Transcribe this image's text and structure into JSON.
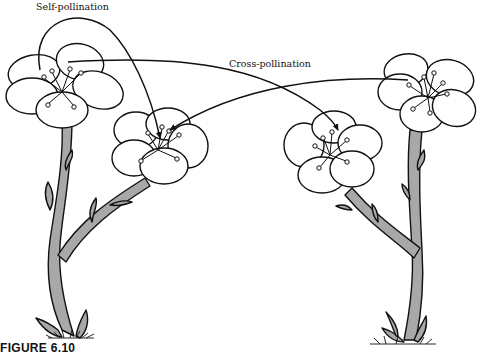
{
  "figure": {
    "caption": "FIGURE 6.10",
    "labels": {
      "self_pollination": "Self-pollination",
      "cross_pollination": "Cross-pollination"
    },
    "plants": [
      {
        "id": "left-plant",
        "flowers": [
          "upper-left-flower",
          "lower-left-flower"
        ]
      },
      {
        "id": "right-plant",
        "flowers": [
          "upper-right-flower",
          "lower-right-flower"
        ]
      }
    ],
    "arrows": [
      {
        "type": "self-pollination",
        "from": "upper-left-flower",
        "to": "lower-left-flower"
      },
      {
        "type": "cross-pollination",
        "from": "upper-left-flower",
        "to": "lower-right-flower"
      },
      {
        "type": "cross-pollination",
        "from": "upper-right-flower",
        "to": "lower-left-flower"
      }
    ],
    "colors": {
      "stem": "#a8a8a8",
      "outline": "#111111",
      "petal": "#ffffff"
    }
  }
}
